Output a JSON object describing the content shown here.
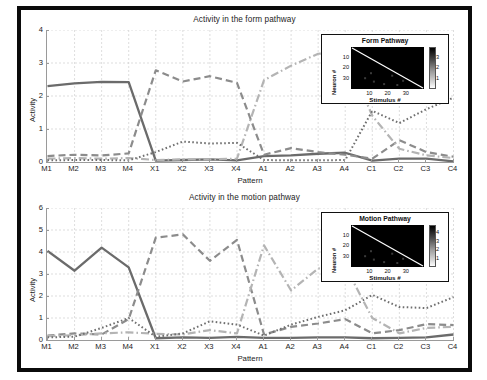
{
  "figure": {
    "background": "#ffffff",
    "frame_color": "#0b0b0b",
    "width": 487,
    "height": 380
  },
  "colors": {
    "solid_series": "#6b6b6b",
    "dashed_series": "#8c8c8c",
    "dashdot_series": "#b4b4b4",
    "dotted_series": "#6f6f6f",
    "grid": "#cfcfcf",
    "axis": "#9a9a9a",
    "text": "#1c1c1c",
    "heatmap_bg": "#000000",
    "heatmap_diagonal": "#ffffff"
  },
  "panels": [
    {
      "id": "form",
      "title": "Activity in the form pathway",
      "xlabel": "Pattern",
      "ylabel": "Activity",
      "ylim": [
        0,
        4
      ],
      "yticks": [
        0,
        1,
        2,
        3,
        4
      ],
      "inset": {
        "title": "Form Pathway",
        "xlabel": "Stimulus #",
        "ylabel": "Neuron #",
        "xticks": [
          10,
          20,
          30
        ],
        "yticks": [
          10,
          20,
          30
        ],
        "colorbar_ticks": [
          1,
          2,
          3
        ]
      }
    },
    {
      "id": "motion",
      "title": "Activity in the motion pathway",
      "xlabel": "Pattern",
      "ylabel": "Activity",
      "ylim": [
        0,
        6
      ],
      "yticks": [
        0,
        1,
        2,
        3,
        4,
        5,
        6
      ],
      "inset": {
        "title": "Motion Pathway",
        "xlabel": "Stimulus #",
        "ylabel": "Neuron #",
        "xticks": [
          10,
          20,
          30
        ],
        "yticks": [
          10,
          20,
          30
        ],
        "colorbar_ticks": [
          1,
          2,
          3,
          4
        ]
      }
    }
  ],
  "chart_data": [
    {
      "type": "line",
      "title": "Activity in the form pathway",
      "xlabel": "Pattern",
      "ylabel": "Activity",
      "ylim": [
        0,
        4
      ],
      "yticks": [
        0,
        1,
        2,
        3,
        4
      ],
      "grid": true,
      "legend": "none",
      "categories": [
        "M1",
        "M2",
        "M3",
        "M4",
        "X1",
        "X2",
        "X3",
        "X4",
        "A1",
        "A2",
        "A3",
        "A4",
        "C1",
        "C2",
        "C3",
        "C4"
      ],
      "series": [
        {
          "name": "solid",
          "style": "solid",
          "color": "#6b6b6b",
          "values": [
            2.3,
            2.38,
            2.43,
            2.42,
            0.04,
            0.06,
            0.08,
            0.05,
            0.18,
            0.2,
            0.25,
            0.28,
            0.04,
            0.1,
            0.1,
            0.02
          ]
        },
        {
          "name": "dashed",
          "style": "dashed",
          "color": "#8c8c8c",
          "values": [
            0.18,
            0.22,
            0.2,
            0.26,
            2.78,
            2.44,
            2.6,
            2.4,
            0.22,
            0.42,
            0.3,
            0.22,
            0.1,
            0.66,
            0.3,
            0.16
          ]
        },
        {
          "name": "dash-dot",
          "style": "dashdot",
          "color": "#b4b4b4",
          "values": [
            0.1,
            0.12,
            0.1,
            0.12,
            0.06,
            0.08,
            0.08,
            0.1,
            2.48,
            2.92,
            3.28,
            3.3,
            1.4,
            0.4,
            0.2,
            0.12
          ]
        },
        {
          "name": "dotted",
          "style": "dotted",
          "color": "#6f6f6f",
          "values": [
            0.05,
            0.06,
            0.06,
            0.05,
            0.3,
            0.62,
            0.56,
            0.58,
            0.06,
            0.05,
            0.05,
            0.06,
            1.55,
            1.18,
            1.6,
            1.95
          ]
        }
      ]
    },
    {
      "type": "line",
      "title": "Activity in the motion pathway",
      "xlabel": "Pattern",
      "ylabel": "Activity",
      "ylim": [
        0,
        6
      ],
      "yticks": [
        0,
        1,
        2,
        3,
        4,
        5,
        6
      ],
      "grid": true,
      "legend": "none",
      "categories": [
        "M1",
        "M2",
        "M3",
        "M4",
        "X1",
        "X2",
        "X3",
        "X4",
        "A1",
        "A2",
        "A3",
        "A4",
        "C1",
        "C2",
        "C3",
        "C4"
      ],
      "series": [
        {
          "name": "solid",
          "style": "solid",
          "color": "#6b6b6b",
          "values": [
            4.05,
            3.15,
            4.2,
            3.3,
            0.08,
            0.12,
            0.1,
            0.14,
            0.1,
            0.1,
            0.12,
            0.12,
            0.08,
            0.1,
            0.12,
            0.25
          ]
        },
        {
          "name": "dashed",
          "style": "dashed",
          "color": "#8c8c8c",
          "values": [
            0.2,
            0.3,
            0.25,
            0.95,
            4.65,
            4.8,
            3.6,
            4.55,
            0.25,
            0.6,
            0.75,
            0.95,
            0.3,
            0.45,
            0.72,
            0.68
          ]
        },
        {
          "name": "dash-dot",
          "style": "dashdot",
          "color": "#b4b4b4",
          "values": [
            0.18,
            0.22,
            0.3,
            0.35,
            0.28,
            0.25,
            0.45,
            0.3,
            4.3,
            2.25,
            3.25,
            3.35,
            1.0,
            0.3,
            0.55,
            0.6
          ]
        },
        {
          "name": "dotted",
          "style": "dotted",
          "color": "#6f6f6f",
          "values": [
            0.12,
            0.15,
            0.55,
            1.0,
            0.15,
            0.3,
            0.85,
            0.7,
            0.2,
            0.7,
            1.05,
            1.35,
            2.05,
            1.5,
            1.45,
            1.95
          ]
        }
      ]
    }
  ]
}
